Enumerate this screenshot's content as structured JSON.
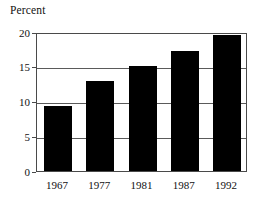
{
  "chart_data": {
    "type": "bar",
    "title": "Percent",
    "xlabel": "",
    "ylabel": "Percent",
    "categories": [
      "1967",
      "1977",
      "1981",
      "1987",
      "1992"
    ],
    "values": [
      9.3,
      12.9,
      15.1,
      17.2,
      19.5
    ],
    "ylim": [
      0,
      20
    ],
    "yticks": [
      "0",
      "5",
      "10",
      "15",
      "20"
    ],
    "ytick_values": [
      0,
      5,
      10,
      15,
      20
    ],
    "grid": true,
    "legend": "none",
    "bar_color": "#000000",
    "frame_color": "#4a4a4a",
    "background": "#ffffff"
  }
}
